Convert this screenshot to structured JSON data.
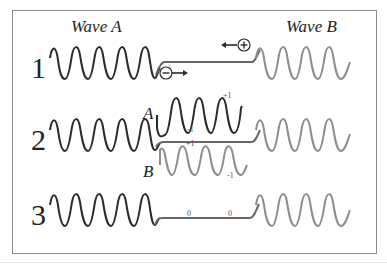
{
  "labels": {
    "wave_a": "Wave A",
    "wave_b": "Wave B"
  },
  "rows": [
    {
      "number": "1"
    },
    {
      "number": "2",
      "upper_label": "A",
      "lower_label": "B",
      "upper_plus": "+1",
      "upper_minus": "-1",
      "lower_plus": "+1",
      "lower_minus": "-1"
    },
    {
      "number": "3",
      "zero_left": "0",
      "zero_right": "0"
    }
  ],
  "charges": {
    "negative": "−",
    "positive": "+"
  },
  "colors": {
    "wave_a": "#2a2a2a",
    "wave_b": "#8c8c8c",
    "frame": "#8a8a8a"
  }
}
